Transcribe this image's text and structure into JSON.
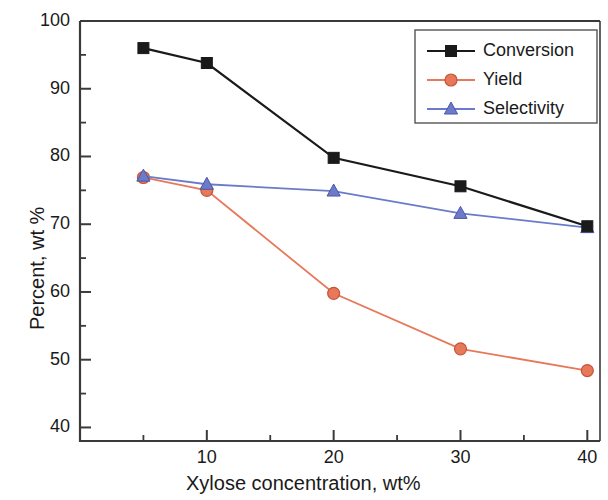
{
  "chart_data": {
    "type": "line",
    "title": "",
    "xlabel": "Xylose concentration, wt%",
    "ylabel": "Percent, wt %",
    "xlim": [
      0,
      41
    ],
    "ylim": [
      38,
      100
    ],
    "xticks": [
      10,
      20,
      30,
      40
    ],
    "yticks": [
      40,
      50,
      60,
      70,
      80,
      90,
      100
    ],
    "x_minor_ticks": [
      5,
      15,
      25,
      35
    ],
    "y_minor_ticks": [
      45,
      55,
      65,
      75,
      85,
      95
    ],
    "grid": false,
    "legend_position": "top-right",
    "x": [
      5,
      10,
      20,
      30,
      40
    ],
    "series": [
      {
        "name": "Conversion",
        "marker": "square",
        "color": "#1a1a1a",
        "values": [
          96.0,
          93.8,
          79.8,
          75.6,
          69.7
        ]
      },
      {
        "name": "Yield",
        "marker": "circle",
        "color": "#E8785A",
        "values": [
          76.9,
          75.0,
          59.8,
          51.6,
          48.4
        ]
      },
      {
        "name": "Selectivity",
        "marker": "triangle",
        "color": "#6B7BC9",
        "values": [
          77.1,
          75.9,
          74.9,
          71.6,
          69.5
        ]
      }
    ]
  },
  "axes": {
    "y_tick_labels": [
      "100",
      "90",
      "80",
      "70",
      "60",
      "50",
      "40"
    ],
    "x_tick_labels": [
      "10",
      "20",
      "30",
      "40"
    ]
  },
  "legend": {
    "items": [
      {
        "label": "Conversion",
        "color": "#1a1a1a",
        "marker": "square"
      },
      {
        "label": "Yield",
        "color": "#E8785A",
        "marker": "circle"
      },
      {
        "label": "Selectivity",
        "color": "#6B7BC9",
        "marker": "triangle"
      }
    ]
  }
}
